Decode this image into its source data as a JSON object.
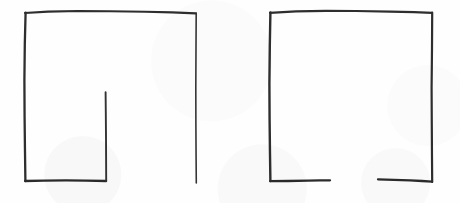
{
  "image": {
    "title": "Scanned hand-drawn figures",
    "description": "Two hand-drawn open rectangles in dark pencil on white paper",
    "width": 460,
    "height": 203,
    "background_color": "#fefefe",
    "ink_color": "#2b2b2b",
    "figure_count": 2
  },
  "figures": [
    {
      "name": "left-figure",
      "label": "Left hand-drawn rectangle with internal vertical line",
      "ink_color": "#2e2e2e",
      "bounds": {
        "x": 24,
        "y": 11,
        "width": 173,
        "height": 172
      },
      "strokes": [
        {
          "name": "top-edge",
          "stroke_width": 2.1,
          "points": "25,13 48,11.6 78,11.0 110,11.2 145,11.8 172,12.4 196,13.4"
        },
        {
          "name": "left-edge",
          "stroke_width": 2.3,
          "points": "25.6,12.6 24.8,44 24.4,80 24.6,118 25.0,152 25.4,181"
        },
        {
          "name": "right-edge",
          "stroke_width": 1.6,
          "points": "196.2,13.2 196.0,48 195.8,88 195.9,126 196.1,158 196.3,183"
        },
        {
          "name": "bottom-edge-left-segment",
          "stroke_width": 2.4,
          "points": "25.2,181.0 44,180.6 66,180.4 86,180.6 106,181.0"
        },
        {
          "name": "internal-vertical-line",
          "stroke_width": 1.9,
          "points": "105.6,92.2 105.8,112 106.0,136 106.1,158 106.2,181"
        }
      ]
    },
    {
      "name": "right-figure",
      "label": "Right hand-drawn rectangle with gap in bottom edge",
      "ink_color": "#2e2e2e",
      "bounds": {
        "x": 269,
        "y": 11,
        "width": 163,
        "height": 172
      },
      "strokes": [
        {
          "name": "top-edge",
          "stroke_width": 2.2,
          "points": "270,12.8 296,11.4 326,10.8 356,11.0 390,11.6 414,12.2 432,12.8"
        },
        {
          "name": "left-edge",
          "stroke_width": 2.4,
          "points": "270.4,12.4 269.8,46 269.4,84 269.6,120 270.0,154 270.4,181"
        },
        {
          "name": "right-edge",
          "stroke_width": 2.2,
          "points": "432.2,12.6 432.0,48 431.6,88 431.8,126 432.0,158 432.2,182"
        },
        {
          "name": "bottom-edge-left-segment",
          "stroke_width": 2.3,
          "points": "270.2,181.2 288,181.0 308,180.6 320,180.4 330,180.3"
        },
        {
          "name": "bottom-edge-right-segment",
          "stroke_width": 2.3,
          "points": "378,179.4 394,179.8 410,180.4 422,181.0 432,181.6"
        }
      ],
      "gap": {
        "name": "bottom-edge-gap",
        "x_start": 330,
        "x_end": 378,
        "y": 180
      }
    }
  ]
}
